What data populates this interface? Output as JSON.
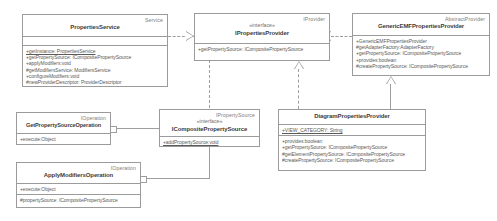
{
  "diagram": {
    "colors": {
      "border": "#9b9b9b",
      "connector": "#9e9e9e",
      "text": "#4a4a4a",
      "background": "#ffffff"
    }
  },
  "classes": {
    "properties_service": {
      "stereotype": "Service",
      "name": "PropertiesService",
      "attributes": [],
      "methods": [
        {
          "text": "+getInstance: PropertiesService",
          "static": true
        },
        {
          "text": "+getPropertySource: ICompositePropertySource",
          "static": false
        },
        {
          "text": "+applyModifiers:void",
          "static": false
        },
        {
          "text": "#getModifiersService: ModifiersService",
          "static": false
        },
        {
          "text": "+configureModifiers:void",
          "static": false
        },
        {
          "text": "#newProviderDescriptor: ProviderDescriptor",
          "static": false
        }
      ]
    },
    "ipropertiesprovider": {
      "stereotype": "IProvider",
      "interface_tag": "«interface»",
      "name": "IPropertiesProvider",
      "methods": [
        {
          "text": "+getPropertySource: ICompositePropertySource",
          "static": false
        }
      ]
    },
    "generic_emf_provider": {
      "stereotype": "AbstractProvider",
      "name": "GenericEMFPropertiesProvider",
      "methods": [
        {
          "text": "+GenericEMFPropertiesProvider",
          "static": false
        },
        {
          "text": "#getAdapterFactory:AdapterFactory",
          "static": false
        },
        {
          "text": "+getPropertySource: ICompositePropertySource",
          "static": false
        },
        {
          "text": "+provides:boolean",
          "static": false
        },
        {
          "text": "#createPropertySource: ICompositePropertySource",
          "static": false
        }
      ]
    },
    "icomposite_property_source": {
      "stereotype": "IPropertySource",
      "interface_tag": "«interface»",
      "name": "ICompositePropertySource",
      "methods": [
        {
          "text": "+addPropertySource:void",
          "static": true
        }
      ]
    },
    "diagram_properties_provider": {
      "stereotype": "",
      "name": "DiagramPropertiesProvider",
      "attributes": [
        {
          "text": "+VIEW_CATEGORY: String",
          "static": true
        }
      ],
      "methods": [
        {
          "text": "+provides:boolean",
          "static": false
        },
        {
          "text": "+getPropertySource: ICompositePropertySource",
          "static": false
        },
        {
          "text": "#getElementPropertySource: ICompositePropertySource",
          "static": false
        },
        {
          "text": "#createPropertySource: ICompositePropertySource",
          "static": false
        }
      ]
    },
    "get_property_source_operation": {
      "stereotype": "IOperation",
      "name": "GetPropertySourceOperation",
      "methods": [
        {
          "text": "+execute:Object",
          "static": false
        }
      ]
    },
    "apply_modifiers_operation": {
      "stereotype": "IOperation",
      "name": "ApplyModifiersOperation",
      "methods": [
        {
          "text": "+execute:Object",
          "static": false
        }
      ],
      "attributes2": [
        {
          "text": "#propertySource: ICompositePropertySource",
          "static": false
        }
      ]
    }
  }
}
